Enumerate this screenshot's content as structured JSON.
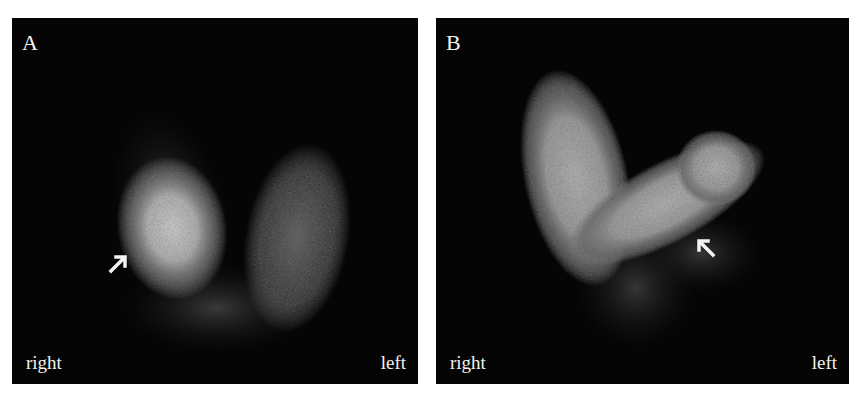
{
  "figure": {
    "panels": [
      {
        "id": "A",
        "label": "A",
        "orientation": {
          "right_label": "right",
          "left_label": "left"
        },
        "arrow": {
          "direction": "up-right",
          "description": "points to bright focal uptake in right lobe"
        }
      },
      {
        "id": "B",
        "label": "B",
        "orientation": {
          "right_label": "right",
          "left_label": "left"
        },
        "arrow": {
          "direction": "up-left",
          "description": "points to reduced uptake area in left lower lobe"
        }
      }
    ],
    "colors": {
      "background": "#050505",
      "text": "#f2f2f2",
      "page": "#ffffff"
    }
  }
}
